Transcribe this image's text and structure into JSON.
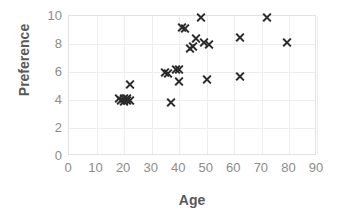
{
  "chart_data": {
    "type": "scatter",
    "title": "",
    "xlabel": "Age",
    "ylabel": "Preference",
    "xlim": [
      0,
      90
    ],
    "ylim": [
      0,
      10
    ],
    "xticks": [
      0,
      10,
      20,
      30,
      40,
      50,
      60,
      70,
      80,
      90
    ],
    "yticks": [
      0,
      2,
      4,
      6,
      8,
      10
    ],
    "grid": true,
    "legend": null,
    "marker": "x",
    "marker_color": "#2b2b2b",
    "series": [
      {
        "name": "Preference vs Age",
        "points": [
          [
            18,
            4.1
          ],
          [
            19,
            4.0
          ],
          [
            20,
            3.9
          ],
          [
            20,
            4.1
          ],
          [
            21,
            4.0
          ],
          [
            21,
            4.1
          ],
          [
            22,
            4.0
          ],
          [
            22,
            5.1
          ],
          [
            35,
            6.0
          ],
          [
            36,
            5.9
          ],
          [
            37,
            3.8
          ],
          [
            39,
            6.2
          ],
          [
            40,
            6.2
          ],
          [
            40,
            5.3
          ],
          [
            41,
            9.2
          ],
          [
            42,
            9.1
          ],
          [
            44,
            7.7
          ],
          [
            45,
            7.8
          ],
          [
            46,
            8.4
          ],
          [
            48,
            9.9
          ],
          [
            49,
            8.1
          ],
          [
            50,
            5.5
          ],
          [
            51,
            8.0
          ],
          [
            62,
            8.5
          ],
          [
            62,
            5.7
          ],
          [
            72,
            9.9
          ],
          [
            79,
            8.1
          ]
        ]
      }
    ]
  },
  "axes": {
    "x": {
      "title": "Age",
      "tick_labels": [
        "0",
        "10",
        "20",
        "30",
        "40",
        "50",
        "60",
        "70",
        "80",
        "90"
      ]
    },
    "y": {
      "title": "Preference",
      "tick_labels": [
        "0",
        "2",
        "4",
        "6",
        "8",
        "10"
      ]
    }
  }
}
